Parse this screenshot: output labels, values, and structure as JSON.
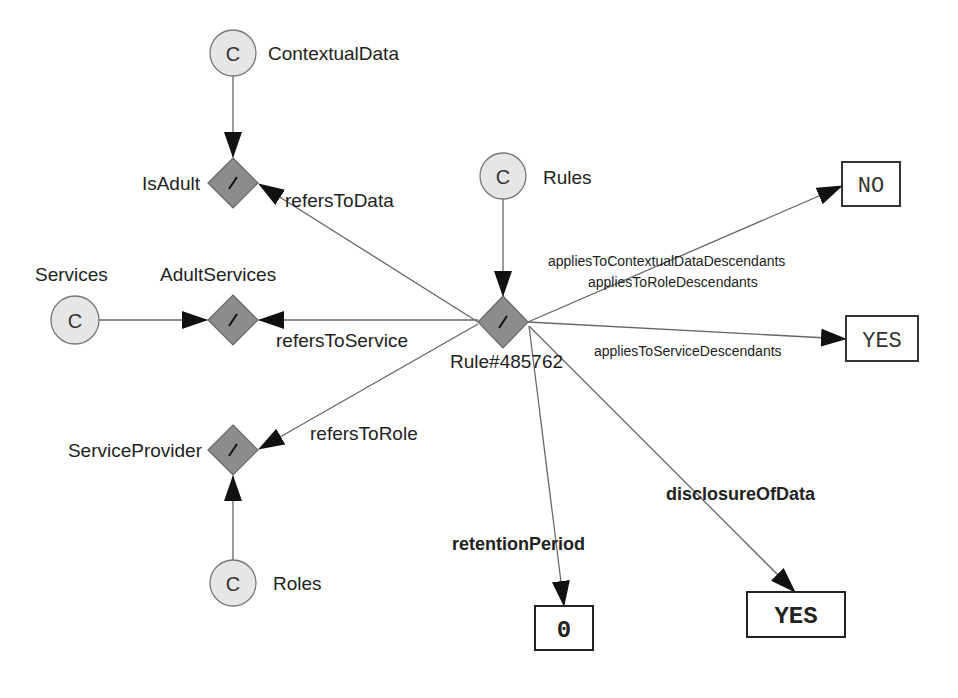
{
  "classes": {
    "contextual_data": {
      "glyph": "C",
      "label": "ContextualData"
    },
    "rules": {
      "glyph": "C",
      "label": "Rules"
    },
    "services": {
      "glyph": "C",
      "label": "Services"
    },
    "roles": {
      "glyph": "C",
      "label": "Roles"
    }
  },
  "instances": {
    "is_adult": {
      "label": "IsAdult"
    },
    "adult_services": {
      "label": "AdultServices"
    },
    "service_provider": {
      "label": "ServiceProvider"
    },
    "rule": {
      "label": "Rule#485762"
    }
  },
  "edges": {
    "refers_to_data": "refersToData",
    "refers_to_service": "refersToService",
    "refers_to_role": "refersToRole",
    "applies_contextual": "appliesToContextualDataDescendants",
    "applies_role": "appliesToRoleDescendants",
    "applies_service": "appliesToServiceDescendants",
    "retention_period": "retentionPeriod",
    "disclosure_of_data": "disclosureOfData"
  },
  "literals": {
    "no": "NO",
    "yes_service": "YES",
    "retention_value": "0",
    "disclosure_value": "YES"
  },
  "colors": {
    "class_fill": "#e6e6e6",
    "instance_fill": "#8c8c8c",
    "line": "#555555"
  }
}
